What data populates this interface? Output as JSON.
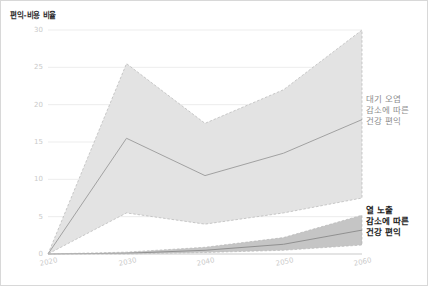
{
  "chart_data": {
    "type": "area",
    "title": "편익-비용 비율",
    "xlabel": "",
    "ylabel": "편익-비용 비율",
    "x": [
      2020,
      2030,
      2040,
      2050,
      2060
    ],
    "xticklabels": [
      "2020",
      "2030",
      "2040",
      "2050",
      "2060"
    ],
    "yticks": [
      0,
      5,
      10,
      15,
      20,
      25,
      30
    ],
    "yticklabels": [
      "0",
      "5",
      "10",
      "15",
      "20",
      "25",
      "30"
    ],
    "xlim": [
      2020,
      2060
    ],
    "ylim": [
      0,
      30
    ],
    "grid": "horizontal",
    "legend_position": "right-inline-annotations",
    "series": [
      {
        "name": "대기 오염 감소에 따른 건강 편익",
        "kind": "band-with-central-line",
        "color": "#e2e2e2",
        "line_color": "#9a9a9a",
        "central": [
          0,
          15.5,
          10.5,
          13.5,
          18.0
        ],
        "upper": [
          0,
          25.5,
          17.5,
          22.0,
          30.0
        ],
        "lower": [
          0,
          5.5,
          4.0,
          5.5,
          7.5
        ]
      },
      {
        "name": "열 노출 감소에 따른 건강 편익",
        "kind": "band-with-central-line",
        "color": "#c2c2c2",
        "line_color": "#8a8a8a",
        "central": [
          0,
          0.1,
          0.5,
          1.3,
          3.2
        ],
        "upper": [
          0,
          0.25,
          0.9,
          2.2,
          5.2
        ],
        "lower": [
          0,
          0.0,
          0.2,
          0.5,
          1.2
        ]
      }
    ],
    "annotations": [
      {
        "id": "air-pollution",
        "lines": [
          "대기 오염",
          "감소에 따른",
          "건강 편익"
        ],
        "emphasis": "normal",
        "color": "#8e8e8e"
      },
      {
        "id": "heat-exposure",
        "lines": [
          "열 노출",
          "감소에 따른",
          "건강 편익"
        ],
        "emphasis": "bold",
        "color": "#1e1e1e"
      }
    ]
  },
  "colors": {
    "air_band": "#e2e2e2",
    "heat_band": "#c2c2c2",
    "gridline": "#ededed",
    "axis": "#c9c9c9",
    "tick_label": "#c9c9c9",
    "title": "#2b2b2b",
    "frame": "#d8d8d8"
  }
}
